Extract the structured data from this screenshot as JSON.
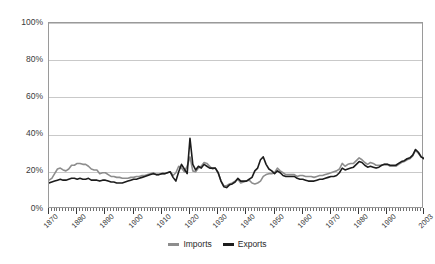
{
  "chart_data": {
    "type": "line",
    "title": "",
    "subtitle": "",
    "xlabel": "",
    "ylabel": "",
    "ylim": [
      0,
      100
    ],
    "xlim": [
      1870,
      2003
    ],
    "y_ticks": [
      "0%",
      "20%",
      "40%",
      "60%",
      "80%",
      "100%"
    ],
    "y_tick_values": [
      0,
      20,
      40,
      60,
      80,
      100
    ],
    "x_ticks": [
      "1870",
      "1880",
      "1890",
      "1900",
      "1910",
      "1920",
      "1930",
      "1940",
      "1950",
      "1960",
      "1970",
      "1980",
      "1990",
      "2003"
    ],
    "x_tick_values": [
      1870,
      1880,
      1890,
      1900,
      1910,
      1920,
      1930,
      1940,
      1950,
      1960,
      1970,
      1980,
      1990,
      2003
    ],
    "grid": true,
    "legend_position": "bottom",
    "colors": {
      "imports": "#8d8d8d",
      "exports": "#1c1c1c",
      "gridline": "#c9c9c9",
      "frame": "#9a9a9a",
      "text": "#2a2a2a",
      "background": "#ffffff"
    },
    "x": [
      1870,
      1871,
      1872,
      1873,
      1874,
      1875,
      1876,
      1877,
      1878,
      1879,
      1880,
      1881,
      1882,
      1883,
      1884,
      1885,
      1886,
      1887,
      1888,
      1889,
      1890,
      1891,
      1892,
      1893,
      1894,
      1895,
      1896,
      1897,
      1898,
      1899,
      1900,
      1901,
      1902,
      1903,
      1904,
      1905,
      1906,
      1907,
      1908,
      1909,
      1910,
      1911,
      1912,
      1913,
      1914,
      1915,
      1916,
      1917,
      1918,
      1919,
      1920,
      1921,
      1922,
      1923,
      1924,
      1925,
      1926,
      1927,
      1928,
      1929,
      1930,
      1931,
      1932,
      1933,
      1934,
      1935,
      1936,
      1937,
      1938,
      1939,
      1940,
      1941,
      1942,
      1943,
      1944,
      1945,
      1946,
      1947,
      1948,
      1949,
      1950,
      1951,
      1952,
      1953,
      1954,
      1955,
      1956,
      1957,
      1958,
      1959,
      1960,
      1961,
      1962,
      1963,
      1964,
      1965,
      1966,
      1967,
      1968,
      1969,
      1970,
      1971,
      1972,
      1973,
      1974,
      1975,
      1976,
      1977,
      1978,
      1979,
      1980,
      1981,
      1982,
      1983,
      1984,
      1985,
      1986,
      1987,
      1988,
      1989,
      1990,
      1991,
      1992,
      1993,
      1994,
      1995,
      1996,
      1997,
      1998,
      1999,
      2000,
      2001,
      2002,
      2003
    ],
    "series": [
      {
        "name": "Imports",
        "color": "#8d8d8d",
        "values": [
          15.5,
          16.5,
          19.0,
          21.5,
          22.0,
          21.0,
          20.5,
          21.5,
          23.5,
          23.5,
          24.5,
          24.5,
          24.0,
          24.0,
          23.0,
          21.5,
          21.0,
          21.0,
          19.0,
          19.5,
          19.5,
          18.5,
          17.5,
          17.5,
          17.0,
          17.0,
          16.5,
          16.5,
          16.5,
          17.0,
          17.0,
          17.5,
          17.5,
          18.0,
          18.0,
          18.5,
          19.0,
          19.5,
          18.5,
          18.5,
          19.0,
          19.0,
          19.5,
          20.0,
          18.0,
          19.5,
          23.0,
          22.0,
          20.0,
          23.0,
          28.0,
          20.5,
          20.0,
          22.0,
          23.0,
          25.0,
          24.5,
          23.0,
          21.5,
          22.0,
          19.5,
          15.0,
          12.5,
          12.5,
          13.5,
          14.0,
          15.0,
          16.0,
          14.0,
          14.5,
          15.0,
          15.5,
          14.0,
          13.5,
          14.0,
          15.0,
          17.5,
          18.5,
          19.0,
          19.0,
          19.5,
          22.0,
          20.5,
          19.5,
          18.5,
          18.5,
          18.5,
          18.5,
          17.5,
          18.0,
          18.0,
          17.5,
          17.5,
          17.5,
          17.0,
          17.5,
          18.0,
          18.0,
          18.5,
          19.0,
          19.5,
          20.0,
          20.5,
          21.5,
          24.5,
          23.0,
          24.0,
          24.5,
          24.5,
          26.0,
          27.5,
          26.5,
          25.0,
          24.0,
          25.0,
          24.5,
          23.5,
          23.5,
          23.5,
          24.0,
          24.0,
          23.0,
          23.0,
          23.0,
          24.0,
          25.0,
          25.5,
          26.5,
          27.0,
          28.5,
          31.5,
          30.0,
          28.0,
          27.5
        ]
      },
      {
        "name": "Exports",
        "color": "#1c1c1c",
        "values": [
          14.0,
          14.5,
          15.0,
          15.5,
          16.0,
          15.5,
          15.5,
          16.0,
          16.5,
          16.5,
          16.0,
          16.5,
          16.0,
          16.0,
          16.5,
          15.5,
          15.5,
          15.5,
          15.0,
          15.5,
          15.5,
          15.0,
          14.5,
          14.5,
          14.0,
          14.0,
          14.0,
          14.5,
          15.0,
          15.5,
          16.0,
          16.0,
          16.5,
          17.0,
          17.5,
          18.0,
          18.5,
          19.0,
          18.5,
          18.5,
          19.0,
          19.0,
          19.5,
          20.0,
          17.0,
          15.0,
          20.0,
          24.0,
          21.5,
          19.0,
          38.0,
          24.0,
          21.0,
          23.0,
          22.0,
          24.0,
          23.0,
          22.0,
          22.0,
          22.0,
          19.5,
          15.0,
          12.0,
          11.5,
          13.0,
          13.5,
          14.5,
          16.5,
          15.0,
          15.0,
          15.0,
          16.0,
          17.0,
          20.5,
          22.0,
          26.5,
          28.0,
          24.0,
          21.5,
          20.5,
          19.0,
          20.5,
          19.5,
          18.0,
          17.5,
          17.5,
          17.5,
          17.5,
          16.5,
          16.0,
          16.0,
          15.5,
          15.0,
          15.0,
          15.0,
          15.5,
          16.0,
          16.0,
          16.5,
          17.0,
          17.5,
          17.5,
          18.0,
          19.5,
          22.0,
          21.0,
          21.5,
          22.0,
          22.5,
          24.0,
          25.5,
          25.0,
          23.5,
          22.5,
          23.0,
          22.5,
          22.0,
          22.5,
          23.5,
          24.0,
          24.0,
          23.5,
          23.5,
          23.5,
          24.5,
          25.5,
          26.0,
          27.0,
          27.5,
          29.0,
          32.0,
          30.5,
          28.0,
          27.0
        ]
      }
    ],
    "legend": [
      {
        "label": "Imports",
        "color": "#8d8d8d"
      },
      {
        "label": "Exports",
        "color": "#1c1c1c"
      }
    ]
  }
}
